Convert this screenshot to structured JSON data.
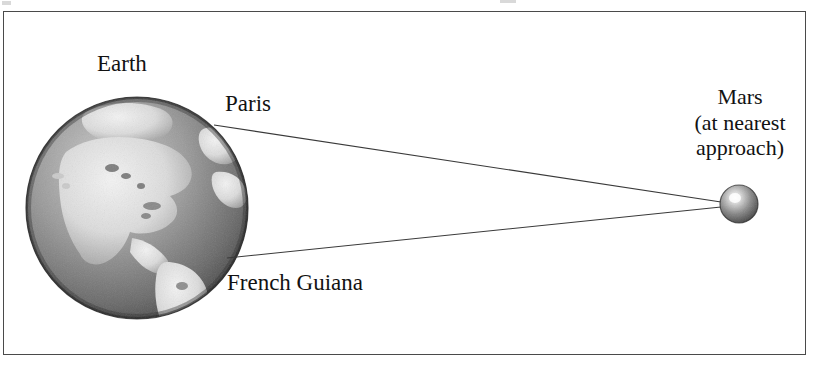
{
  "figure": {
    "frame": {
      "border_color": "#4a4a4a",
      "background": "#ffffff"
    },
    "labels": {
      "earth": "Earth",
      "paris": "Paris",
      "french_guiana": "French Guiana",
      "mars_line1": "Mars",
      "mars_line2": "(at nearest",
      "mars_line3": "approach)"
    },
    "bodies": {
      "earth": {
        "name": "Earth",
        "center_x": 137,
        "center_y": 208,
        "radius": 111,
        "style": "grayscale shaded globe showing the Americas"
      },
      "mars": {
        "name": "Mars",
        "center_x": 739,
        "center_y": 204,
        "radius": 19,
        "style": "small grayscale shaded sphere with highlight"
      }
    },
    "sight_lines": [
      {
        "from": "Paris",
        "from_x": 214,
        "from_y": 125,
        "to_x": 721,
        "to_y": 202
      },
      {
        "from": "French Guiana",
        "from_x": 227,
        "from_y": 258,
        "to_x": 721,
        "to_y": 207
      }
    ],
    "colors": {
      "line": "#3a3a3a",
      "text": "#121212",
      "ocean_dark": "#585858",
      "land_light": "#e6e6e6",
      "mars_body": "#6d6d6d",
      "mars_highlight": "#f2f2f2"
    }
  }
}
